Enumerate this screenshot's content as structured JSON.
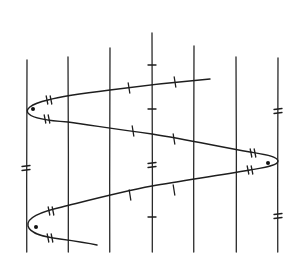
{
  "diagram": {
    "type": "hand-drawn zigzag curve crossing parallel vertical lines",
    "stroke_color": "#1e1e1e",
    "background": "#ffffff",
    "vertical_lines": [
      {
        "x": 27,
        "y1": 60,
        "y2": 252
      },
      {
        "x": 68,
        "y1": 57,
        "y2": 252
      },
      {
        "x": 110,
        "y1": 48,
        "y2": 252
      },
      {
        "x": 152,
        "y1": 33,
        "y2": 252
      },
      {
        "x": 194,
        "y1": 46,
        "y2": 252
      },
      {
        "x": 236,
        "y1": 57,
        "y2": 252
      },
      {
        "x": 278,
        "y1": 58,
        "y2": 252
      }
    ],
    "curve_path": "M 210 79 C 175 82, 140 86, 110 90 C 85 93, 62 96, 48 100 C 30 104, 24 110, 29 114 C 34 119, 52 121, 68 122 C 90 125, 115 129, 152 134 C 190 140, 220 147, 250 152 C 262 154, 278 156, 278 161 C 278 166, 262 168, 250 170 C 215 176, 180 181, 152 186 C 120 192, 90 200, 62 207 C 40 212, 26 218, 28 226 C 30 234, 45 237, 60 239 C 75 241, 88 243, 97 245",
    "turn_points": [
      {
        "x": 27,
        "y": 108,
        "dot": {
          "x": 33,
          "y": 109
        }
      },
      {
        "x": 278,
        "y": 161,
        "dot": {
          "x": 268,
          "y": 163
        }
      },
      {
        "x": 27,
        "y": 226,
        "dot": {
          "x": 36,
          "y": 227
        }
      }
    ],
    "single_ticks": [
      {
        "x": 129,
        "y": 88,
        "orient": "curve"
      },
      {
        "x": 175,
        "y": 82,
        "orient": "curve"
      },
      {
        "x": 133,
        "y": 131,
        "orient": "curve"
      },
      {
        "x": 174,
        "y": 139,
        "orient": "curve"
      },
      {
        "x": 130,
        "y": 195,
        "orient": "curve"
      },
      {
        "x": 174,
        "y": 190,
        "orient": "curve"
      }
    ],
    "double_ticks_curve": [
      {
        "x": 49,
        "y": 100
      },
      {
        "x": 47,
        "y": 119
      },
      {
        "x": 253,
        "y": 153
      },
      {
        "x": 250,
        "y": 170
      },
      {
        "x": 51,
        "y": 211
      },
      {
        "x": 50,
        "y": 238
      }
    ],
    "line_ticks_single": [
      {
        "x": 152,
        "y": 65
      },
      {
        "x": 152,
        "y": 109
      },
      {
        "x": 152,
        "y": 217
      }
    ],
    "line_ticks_double": [
      {
        "x": 152,
        "y": 165
      },
      {
        "x": 26,
        "y": 168
      },
      {
        "x": 278,
        "y": 111
      },
      {
        "x": 278,
        "y": 216
      }
    ]
  }
}
